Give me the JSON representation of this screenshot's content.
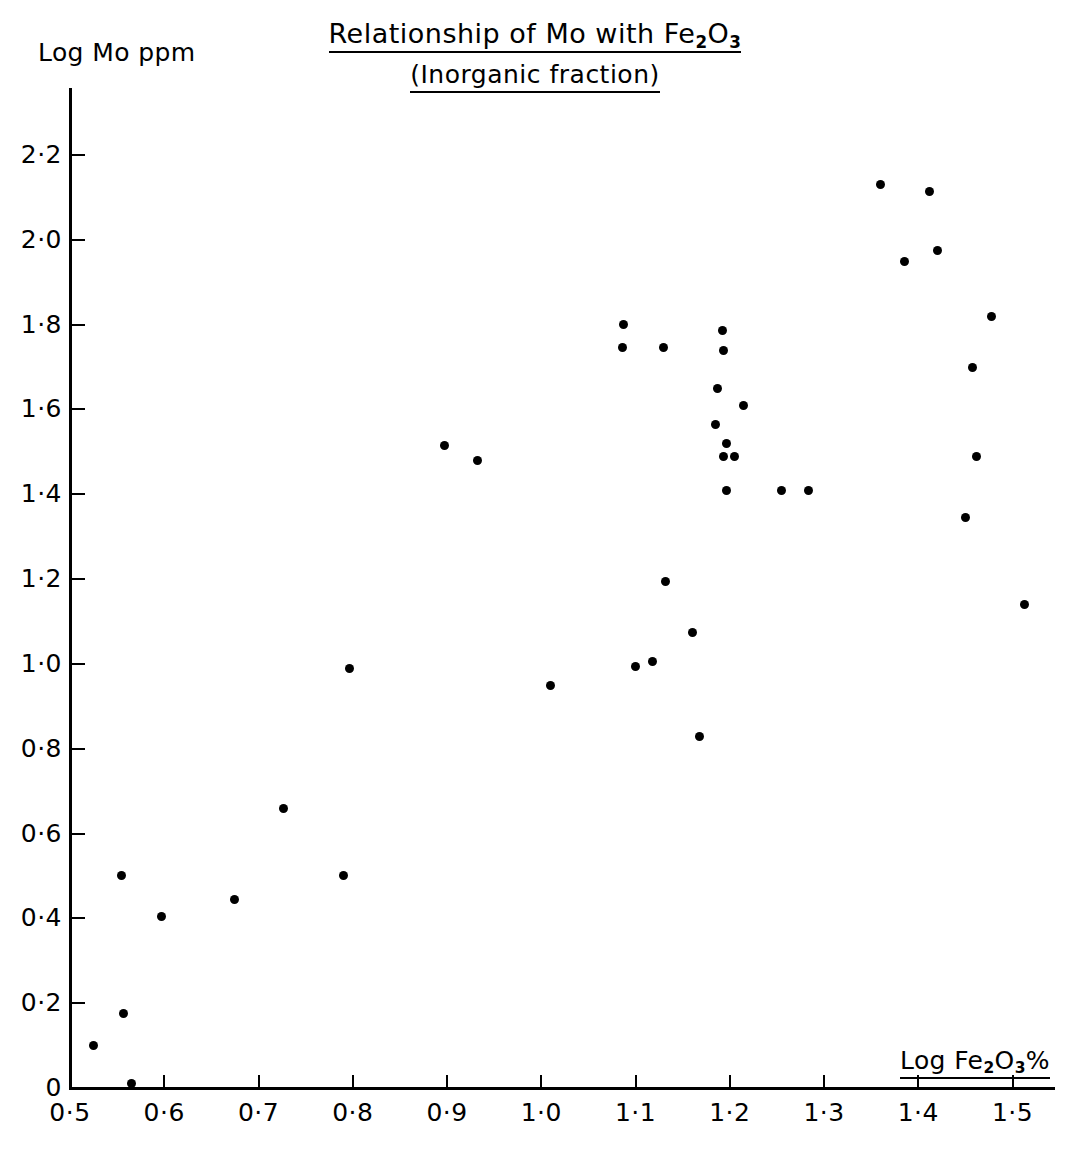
{
  "chart_data": {
    "type": "scatter",
    "title": "Relationship of Mo with Fe2O3",
    "title_html": "Relationship of Mo with Fe<sub>2</sub>O<sub>3</sub>",
    "subtitle": "(Inorganic fraction)",
    "xlabel": "Log Fe2O3%",
    "xlabel_html": "Log Fe<sub>2</sub>O<sub>3</sub>%",
    "ylabel": "Log Mo ppm",
    "xlim": [
      0.5,
      1.545
    ],
    "ylim": [
      0.0,
      2.36
    ],
    "grid": false,
    "legend": null,
    "marker": "filled-circle",
    "marker_color": "#000000",
    "xticks": [
      0.5,
      0.6,
      0.7,
      0.8,
      0.9,
      1.0,
      1.1,
      1.2,
      1.3,
      1.4,
      1.5
    ],
    "xticklabels": [
      "0·5",
      "0·6",
      "0·7",
      "0·8",
      "0·9",
      "1·0",
      "1·1",
      "1·2",
      "1·3",
      "1·4",
      "1·5"
    ],
    "yticks": [
      0.0,
      0.2,
      0.4,
      0.6,
      0.8,
      1.0,
      1.2,
      1.4,
      1.6,
      1.8,
      2.0,
      2.2
    ],
    "yticklabels": [
      "0",
      "0·2",
      "0·4",
      "0·6",
      "0·8",
      "1·0",
      "1·2",
      "1·4",
      "1·6",
      "1·8",
      "2·0",
      "2·2"
    ],
    "points": [
      {
        "x": 0.525,
        "y": 0.1
      },
      {
        "x": 0.557,
        "y": 0.175
      },
      {
        "x": 0.565,
        "y": 0.01
      },
      {
        "x": 0.555,
        "y": 0.5
      },
      {
        "x": 0.597,
        "y": 0.405
      },
      {
        "x": 0.675,
        "y": 0.445
      },
      {
        "x": 0.727,
        "y": 0.66
      },
      {
        "x": 0.79,
        "y": 0.5
      },
      {
        "x": 0.797,
        "y": 0.99
      },
      {
        "x": 0.897,
        "y": 1.515
      },
      {
        "x": 0.932,
        "y": 1.48
      },
      {
        "x": 1.01,
        "y": 0.95
      },
      {
        "x": 1.087,
        "y": 1.8
      },
      {
        "x": 1.086,
        "y": 1.745
      },
      {
        "x": 1.1,
        "y": 0.995
      },
      {
        "x": 1.118,
        "y": 1.005
      },
      {
        "x": 1.13,
        "y": 1.745
      },
      {
        "x": 1.132,
        "y": 1.195
      },
      {
        "x": 1.16,
        "y": 1.075
      },
      {
        "x": 1.168,
        "y": 0.83
      },
      {
        "x": 1.192,
        "y": 1.785
      },
      {
        "x": 1.193,
        "y": 1.74
      },
      {
        "x": 1.187,
        "y": 1.65
      },
      {
        "x": 1.185,
        "y": 1.565
      },
      {
        "x": 1.196,
        "y": 1.52
      },
      {
        "x": 1.193,
        "y": 1.49
      },
      {
        "x": 1.205,
        "y": 1.49
      },
      {
        "x": 1.197,
        "y": 1.41
      },
      {
        "x": 1.215,
        "y": 1.61
      },
      {
        "x": 1.255,
        "y": 1.41
      },
      {
        "x": 1.283,
        "y": 1.41
      },
      {
        "x": 1.36,
        "y": 2.13
      },
      {
        "x": 1.385,
        "y": 1.95
      },
      {
        "x": 1.412,
        "y": 2.115
      },
      {
        "x": 1.42,
        "y": 1.975
      },
      {
        "x": 1.45,
        "y": 1.345
      },
      {
        "x": 1.458,
        "y": 1.7
      },
      {
        "x": 1.462,
        "y": 1.49
      },
      {
        "x": 1.478,
        "y": 1.82
      },
      {
        "x": 1.513,
        "y": 1.14
      }
    ]
  }
}
